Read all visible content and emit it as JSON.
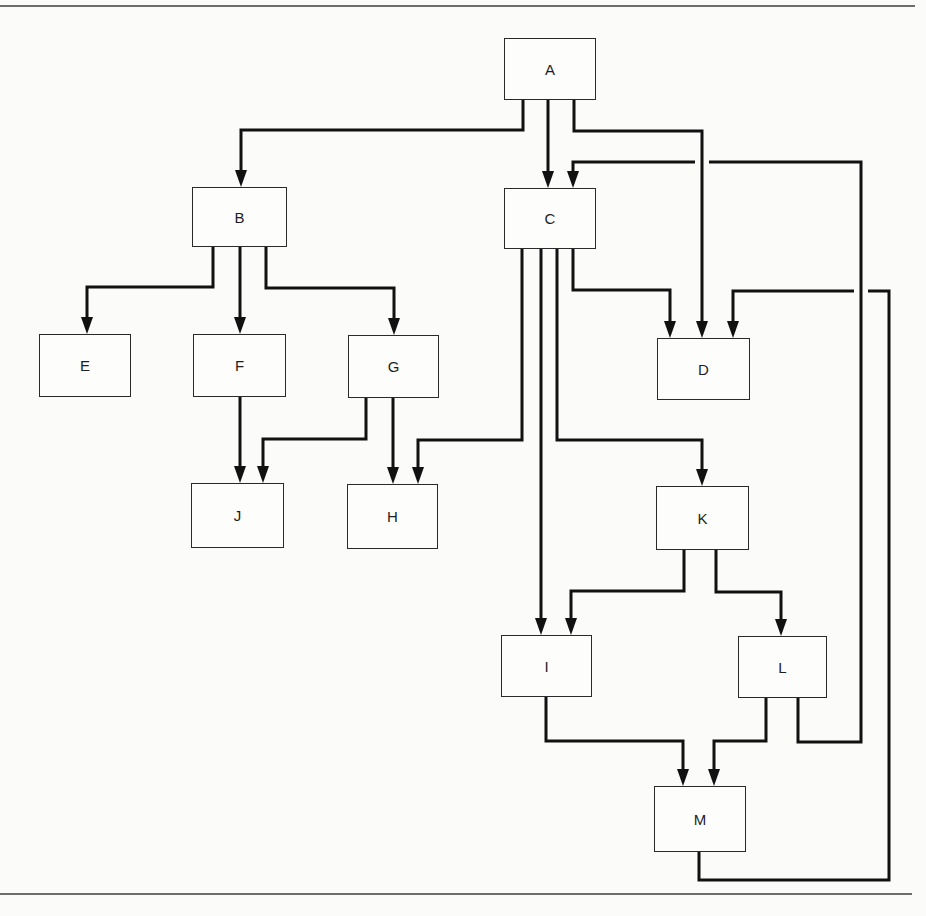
{
  "diagram": {
    "type": "flowchart",
    "stroke_color": "#111111",
    "nodes": [
      {
        "id": "A",
        "label": "A",
        "x": 504,
        "y": 38,
        "w": 92,
        "h": 62
      },
      {
        "id": "B",
        "label": "B",
        "x": 192,
        "y": 187,
        "w": 95,
        "h": 60
      },
      {
        "id": "C",
        "label": "C",
        "x": 504,
        "y": 188,
        "w": 92,
        "h": 61
      },
      {
        "id": "D",
        "label": "D",
        "x": 657,
        "y": 338,
        "w": 93,
        "h": 62
      },
      {
        "id": "E",
        "label": "E",
        "x": 39,
        "y": 334,
        "w": 92,
        "h": 63
      },
      {
        "id": "F",
        "label": "F",
        "x": 193,
        "y": 334,
        "w": 93,
        "h": 63
      },
      {
        "id": "G",
        "label": "G",
        "x": 348,
        "y": 335,
        "w": 91,
        "h": 63
      },
      {
        "id": "H",
        "label": "H",
        "x": 347,
        "y": 484,
        "w": 91,
        "h": 65
      },
      {
        "id": "J",
        "label": "J",
        "x": 191,
        "y": 483,
        "w": 93,
        "h": 65
      },
      {
        "id": "K",
        "label": "K",
        "x": 656,
        "y": 486,
        "w": 93,
        "h": 64
      },
      {
        "id": "I",
        "label": "I",
        "x": 501,
        "y": 635,
        "w": 91,
        "h": 62
      },
      {
        "id": "L",
        "label": "L",
        "x": 738,
        "y": 636,
        "w": 89,
        "h": 62
      },
      {
        "id": "M",
        "label": "M",
        "x": 654,
        "y": 786,
        "w": 92,
        "h": 66
      }
    ],
    "edges": [
      {
        "from": "A",
        "to": "B",
        "points": [
          [
            523,
            100
          ],
          [
            523,
            130
          ],
          [
            241,
            130
          ],
          [
            241,
            187
          ]
        ]
      },
      {
        "from": "A",
        "to": "C",
        "points": [
          [
            548,
            100
          ],
          [
            548,
            188
          ]
        ]
      },
      {
        "from": "A",
        "to": "D",
        "points": [
          [
            574,
            100
          ],
          [
            574,
            131
          ],
          [
            702,
            131
          ],
          [
            702,
            338
          ]
        ]
      },
      {
        "from": "B",
        "to": "E",
        "points": [
          [
            213,
            247
          ],
          [
            213,
            287
          ],
          [
            87,
            287
          ],
          [
            87,
            334
          ]
        ]
      },
      {
        "from": "B",
        "to": "F",
        "points": [
          [
            240,
            247
          ],
          [
            240,
            334
          ]
        ]
      },
      {
        "from": "B",
        "to": "G",
        "points": [
          [
            266,
            247
          ],
          [
            266,
            288
          ],
          [
            394,
            288
          ],
          [
            394,
            335
          ]
        ]
      },
      {
        "from": "F",
        "to": "J",
        "points": [
          [
            240,
            397
          ],
          [
            240,
            483
          ]
        ]
      },
      {
        "from": "G",
        "to": "J",
        "points": [
          [
            366,
            398
          ],
          [
            366,
            439
          ],
          [
            263,
            439
          ],
          [
            263,
            483
          ]
        ]
      },
      {
        "from": "G",
        "to": "H",
        "points": [
          [
            393,
            398
          ],
          [
            393,
            484
          ]
        ]
      },
      {
        "from": "C",
        "to": "H",
        "points": [
          [
            522,
            249
          ],
          [
            522,
            440
          ],
          [
            418,
            440
          ],
          [
            418,
            484
          ]
        ]
      },
      {
        "from": "C",
        "to": "I",
        "points": [
          [
            541,
            249
          ],
          [
            541,
            635
          ]
        ]
      },
      {
        "from": "C",
        "to": "K",
        "points": [
          [
            557,
            249
          ],
          [
            557,
            440
          ],
          [
            702,
            440
          ],
          [
            702,
            486
          ]
        ]
      },
      {
        "from": "C",
        "to": "D",
        "points": [
          [
            573,
            249
          ],
          [
            573,
            290
          ],
          [
            670,
            290
          ],
          [
            670,
            338
          ]
        ]
      },
      {
        "from": "K",
        "to": "I",
        "points": [
          [
            684,
            550
          ],
          [
            684,
            591
          ],
          [
            571,
            591
          ],
          [
            571,
            635
          ]
        ]
      },
      {
        "from": "K",
        "to": "L",
        "points": [
          [
            716,
            550
          ],
          [
            716,
            592
          ],
          [
            781,
            592
          ],
          [
            781,
            636
          ]
        ]
      },
      {
        "from": "I",
        "to": "M",
        "points": [
          [
            546,
            697
          ],
          [
            546,
            741
          ],
          [
            683,
            741
          ],
          [
            683,
            786
          ]
        ]
      },
      {
        "from": "L",
        "to": "M",
        "points": [
          [
            766,
            698
          ],
          [
            766,
            741
          ],
          [
            714,
            741
          ],
          [
            714,
            786
          ]
        ]
      },
      {
        "from": "L",
        "to": "C",
        "points": [
          [
            798,
            698
          ],
          [
            798,
            742
          ],
          [
            861,
            742
          ],
          [
            861,
            162
          ],
          [
            573,
            162
          ],
          [
            573,
            188
          ]
        ],
        "crossing_gap": {
          "x": 702,
          "y": 162
        }
      },
      {
        "from": "M",
        "to": "D",
        "points": [
          [
            699,
            852
          ],
          [
            699,
            880
          ],
          [
            889,
            880
          ],
          [
            889,
            291
          ],
          [
            733,
            291
          ],
          [
            733,
            338
          ]
        ],
        "crossing_gap": {
          "x": 861,
          "y": 291
        }
      }
    ]
  }
}
